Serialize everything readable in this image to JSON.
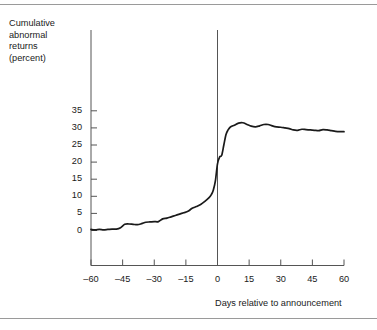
{
  "figure": {
    "y_axis_title": "Cumulative\nabnormal\nreturns\n(percent)",
    "x_axis_title": "Days relative to announcement"
  },
  "colors": {
    "line": "#1a1a1a",
    "axis": "#555555",
    "rule": "#9a9a9a",
    "event_line": "#555555",
    "background": "#ffffff"
  },
  "chart_data": {
    "type": "line",
    "title": "",
    "subtitle": "",
    "xlabel": "Days relative to announcement",
    "ylabel": "Cumulative abnormal returns (percent)",
    "xlim": [
      -60,
      60
    ],
    "ylim": [
      -5,
      38
    ],
    "grid": false,
    "legend": "none",
    "x_ticks": [
      -60,
      -45,
      -30,
      -15,
      0,
      15,
      30,
      45,
      60
    ],
    "x_tick_labels": [
      "–60",
      "–45",
      "–30",
      "–15",
      "0",
      "15",
      "30",
      "45",
      "60"
    ],
    "y_ticks": [
      0,
      5,
      10,
      15,
      20,
      25,
      30,
      35
    ],
    "y_tick_labels": [
      "0",
      "5",
      "10",
      "15",
      "20",
      "25",
      "30",
      "35"
    ],
    "annotations": [
      {
        "type": "vertical-line",
        "x": 0,
        "label": "announcement day"
      }
    ],
    "series": [
      {
        "name": "Cumulative abnormal return",
        "x": [
          -60,
          -58,
          -56,
          -54,
          -52,
          -50,
          -48,
          -46,
          -44,
          -42,
          -40,
          -38,
          -36,
          -34,
          -32,
          -30,
          -28,
          -26,
          -24,
          -22,
          -20,
          -18,
          -16,
          -14,
          -12,
          -10,
          -8,
          -6,
          -4,
          -3,
          -2,
          -1,
          0,
          1,
          2,
          3,
          4,
          5,
          6,
          8,
          10,
          12,
          14,
          16,
          18,
          20,
          22,
          24,
          26,
          28,
          30,
          32,
          34,
          36,
          38,
          40,
          42,
          44,
          46,
          48,
          50,
          52,
          54,
          56,
          58,
          60
        ],
        "values": [
          0.3,
          0.2,
          0.3,
          0.2,
          0.3,
          0.4,
          0.4,
          0.8,
          1.8,
          1.9,
          1.8,
          1.7,
          2.0,
          2.4,
          2.5,
          2.6,
          2.6,
          3.4,
          3.6,
          4.0,
          4.4,
          4.8,
          5.2,
          5.6,
          6.5,
          7.0,
          7.6,
          8.5,
          9.6,
          10.4,
          11.8,
          14.5,
          19.5,
          21.5,
          22.0,
          25.0,
          28.0,
          29.4,
          30.2,
          30.8,
          31.4,
          31.5,
          31.0,
          30.5,
          30.3,
          30.6,
          31.0,
          31.0,
          30.6,
          30.3,
          30.2,
          30.0,
          29.8,
          29.4,
          29.3,
          29.6,
          29.5,
          29.4,
          29.3,
          29.2,
          29.5,
          29.4,
          29.2,
          29.0,
          28.9,
          28.9
        ],
        "color": "#1a1a1a"
      }
    ]
  }
}
